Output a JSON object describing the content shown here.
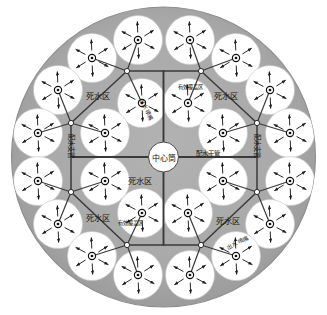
{
  "figure": {
    "type": "engineering-schematic",
    "colors": {
      "dead_zone_fill": "#a8a8a8",
      "coverage_fill": "#ffffff",
      "outline": "#6e6e6e",
      "pipe": "#3a3a3a",
      "text": "#15150f",
      "node_fill": "#ffffff",
      "background": "#ffffff"
    },
    "tank": {
      "cx": 163.5,
      "cy": 157,
      "rx": 152,
      "ry": 150
    },
    "center_cylinder": {
      "cx": 163.5,
      "cy": 157,
      "r": 15
    }
  },
  "labels": {
    "center_cylinder": "中心筒",
    "main_pipe": "配水干管",
    "branch_pipe": "配水支管",
    "dead_zone": "死水区",
    "coverage_zone": "有效覆盖区",
    "nozzle": "出水喷嘴"
  },
  "label_placements": [
    {
      "name": "center-cylinder-label",
      "key": "center_cylinder",
      "x": 163.5,
      "y": 158,
      "size": 8.0,
      "rot": 0,
      "anchor": "middle"
    },
    {
      "name": "main-pipe-label-right",
      "key": "main_pipe",
      "x": 196,
      "y": 154,
      "size": 6.4,
      "rot": 0,
      "anchor": "start"
    },
    {
      "name": "branch-pipe-label-left",
      "key": "branch_pipe",
      "x": 71,
      "y": 146,
      "size": 6.4,
      "rot": 90,
      "anchor": "middle"
    },
    {
      "name": "branch-pipe-label-right",
      "key": "branch_pipe",
      "x": 257,
      "y": 146,
      "size": 6.4,
      "rot": 90,
      "anchor": "middle"
    },
    {
      "name": "dead-zone-label-tl",
      "key": "dead_zone",
      "x": 98,
      "y": 96,
      "size": 8.2,
      "rot": 0,
      "anchor": "middle"
    },
    {
      "name": "dead-zone-label-tr",
      "key": "dead_zone",
      "x": 226,
      "y": 96,
      "size": 8.2,
      "rot": 0,
      "anchor": "middle"
    },
    {
      "name": "dead-zone-label-mid",
      "key": "dead_zone",
      "x": 140,
      "y": 181,
      "size": 8.2,
      "rot": 0,
      "anchor": "middle"
    },
    {
      "name": "dead-zone-label-bl",
      "key": "dead_zone",
      "x": 98,
      "y": 218,
      "size": 8.2,
      "rot": 0,
      "anchor": "middle"
    },
    {
      "name": "dead-zone-label-br",
      "key": "dead_zone",
      "x": 228,
      "y": 221,
      "size": 8.2,
      "rot": 0,
      "anchor": "middle"
    },
    {
      "name": "coverage-zone-label-top",
      "key": "coverage_zone",
      "x": 190,
      "y": 88,
      "size": 5.4,
      "rot": 0,
      "anchor": "middle"
    },
    {
      "name": "coverage-zone-label-bot",
      "key": "coverage_zone",
      "x": 130,
      "y": 224,
      "size": 5.4,
      "rot": 0,
      "anchor": "middle"
    },
    {
      "name": "nozzle-label-top",
      "key": "nozzle",
      "x": 146,
      "y": 110,
      "size": 5.6,
      "rot": 62,
      "anchor": "middle"
    },
    {
      "name": "nozzle-label-bottom",
      "key": "nozzle",
      "x": 238,
      "y": 243,
      "size": 5.6,
      "rot": -28,
      "anchor": "middle"
    }
  ],
  "nozzles": [
    {
      "id": "n01",
      "cx": 138,
      "cy": 40,
      "r": 24.5
    },
    {
      "id": "n02",
      "cx": 190,
      "cy": 40,
      "r": 24.5
    },
    {
      "id": "n03",
      "cx": 92,
      "cy": 58,
      "r": 24.5
    },
    {
      "id": "n04",
      "cx": 236,
      "cy": 58,
      "r": 24.5
    },
    {
      "id": "n05",
      "cx": 58,
      "cy": 90,
      "r": 24.5
    },
    {
      "id": "n06",
      "cx": 270,
      "cy": 90,
      "r": 24.5
    },
    {
      "id": "n07",
      "cx": 142,
      "cy": 103,
      "r": 24.5
    },
    {
      "id": "n08",
      "cx": 188,
      "cy": 103,
      "r": 24.5
    },
    {
      "id": "n09",
      "cx": 38,
      "cy": 133,
      "r": 24.5
    },
    {
      "id": "n10",
      "cx": 105,
      "cy": 133,
      "r": 24.5
    },
    {
      "id": "n11",
      "cx": 223,
      "cy": 133,
      "r": 24.5
    },
    {
      "id": "n12",
      "cx": 290,
      "cy": 133,
      "r": 24.5
    },
    {
      "id": "n13",
      "cx": 38,
      "cy": 181,
      "r": 24.5
    },
    {
      "id": "n14",
      "cx": 105,
      "cy": 181,
      "r": 24.5
    },
    {
      "id": "n15",
      "cx": 223,
      "cy": 181,
      "r": 24.5
    },
    {
      "id": "n16",
      "cx": 290,
      "cy": 181,
      "r": 24.5
    },
    {
      "id": "n17",
      "cx": 142,
      "cy": 213,
      "r": 24.5
    },
    {
      "id": "n18",
      "cx": 188,
      "cy": 213,
      "r": 24.5
    },
    {
      "id": "n19",
      "cx": 58,
      "cy": 224,
      "r": 24.5
    },
    {
      "id": "n20",
      "cx": 270,
      "cy": 224,
      "r": 24.5
    },
    {
      "id": "n21",
      "cx": 92,
      "cy": 256,
      "r": 24.5
    },
    {
      "id": "n22",
      "cx": 236,
      "cy": 256,
      "r": 24.5
    },
    {
      "id": "n23",
      "cx": 138,
      "cy": 275,
      "r": 24.5
    },
    {
      "id": "n24",
      "cx": 190,
      "cy": 275,
      "r": 24.5
    }
  ],
  "junction_nodes": [
    {
      "id": "j-top-left",
      "cx": 127,
      "cy": 71
    },
    {
      "id": "j-top-right",
      "cx": 201,
      "cy": 71
    },
    {
      "id": "j-mid-left",
      "cx": 71,
      "cy": 123
    },
    {
      "id": "j-mid-right",
      "cx": 257,
      "cy": 123
    },
    {
      "id": "j-low-left",
      "cx": 71,
      "cy": 192
    },
    {
      "id": "j-low-right",
      "cx": 257,
      "cy": 192
    },
    {
      "id": "j-bottom-left",
      "cx": 127,
      "cy": 245
    },
    {
      "id": "j-bottom-right",
      "cx": 201,
      "cy": 245
    }
  ],
  "main_pipes": [
    {
      "id": "main-up",
      "x1": 163.5,
      "y1": 142,
      "x2": 163.5,
      "y2": 71
    },
    {
      "id": "main-down",
      "x1": 163.5,
      "y1": 172,
      "x2": 163.5,
      "y2": 245
    },
    {
      "id": "main-left",
      "x1": 148.5,
      "y1": 157,
      "x2": 71,
      "y2": 157
    },
    {
      "id": "main-right",
      "x1": 178.5,
      "y1": 157,
      "x2": 257,
      "y2": 157
    }
  ],
  "branch_pipes": [
    {
      "id": "b-top",
      "x1": 127,
      "y1": 71,
      "x2": 201,
      "y2": 71
    },
    {
      "id": "b-bottom",
      "x1": 127,
      "y1": 245,
      "x2": 201,
      "y2": 245
    },
    {
      "id": "b-left",
      "x1": 71,
      "y1": 123,
      "x2": 71,
      "y2": 192
    },
    {
      "id": "b-right",
      "x1": 257,
      "y1": 123,
      "x2": 257,
      "y2": 192
    },
    {
      "id": "b-tl-diag",
      "x1": 127,
      "y1": 71,
      "x2": 71,
      "y2": 123
    },
    {
      "id": "b-tr-diag",
      "x1": 201,
      "y1": 71,
      "x2": 257,
      "y2": 123
    },
    {
      "id": "b-bl-diag",
      "x1": 127,
      "y1": 245,
      "x2": 71,
      "y2": 192
    },
    {
      "id": "b-br-diag",
      "x1": 201,
      "y1": 245,
      "x2": 257,
      "y2": 192
    }
  ],
  "riser_pipes": [
    {
      "id": "r-j1-n01",
      "x1": 127,
      "y1": 71,
      "x2": 138,
      "y2": 40
    },
    {
      "id": "r-j1-n07",
      "x1": 127,
      "y1": 71,
      "x2": 142,
      "y2": 103
    },
    {
      "id": "r-j1-n03",
      "x1": 127,
      "y1": 71,
      "x2": 92,
      "y2": 58
    },
    {
      "id": "r-j2-n02",
      "x1": 201,
      "y1": 71,
      "x2": 190,
      "y2": 40
    },
    {
      "id": "r-j2-n08",
      "x1": 201,
      "y1": 71,
      "x2": 188,
      "y2": 103
    },
    {
      "id": "r-j2-n04",
      "x1": 201,
      "y1": 71,
      "x2": 236,
      "y2": 58
    },
    {
      "id": "r-j3-n05",
      "x1": 71,
      "y1": 123,
      "x2": 58,
      "y2": 90
    },
    {
      "id": "r-j3-n09",
      "x1": 71,
      "y1": 123,
      "x2": 38,
      "y2": 133
    },
    {
      "id": "r-j3-n10",
      "x1": 71,
      "y1": 123,
      "x2": 105,
      "y2": 133
    },
    {
      "id": "r-j4-n06",
      "x1": 257,
      "y1": 123,
      "x2": 270,
      "y2": 90
    },
    {
      "id": "r-j4-n12",
      "x1": 257,
      "y1": 123,
      "x2": 290,
      "y2": 133
    },
    {
      "id": "r-j4-n11",
      "x1": 257,
      "y1": 123,
      "x2": 223,
      "y2": 133
    },
    {
      "id": "r-j5-n13",
      "x1": 71,
      "y1": 192,
      "x2": 38,
      "y2": 181
    },
    {
      "id": "r-j5-n14",
      "x1": 71,
      "y1": 192,
      "x2": 105,
      "y2": 181
    },
    {
      "id": "r-j5-n19",
      "x1": 71,
      "y1": 192,
      "x2": 58,
      "y2": 224
    },
    {
      "id": "r-j6-n16",
      "x1": 257,
      "y1": 192,
      "x2": 290,
      "y2": 181
    },
    {
      "id": "r-j6-n15",
      "x1": 257,
      "y1": 192,
      "x2": 223,
      "y2": 181
    },
    {
      "id": "r-j6-n20",
      "x1": 257,
      "y1": 192,
      "x2": 270,
      "y2": 224
    },
    {
      "id": "r-j7-n17",
      "x1": 127,
      "y1": 245,
      "x2": 142,
      "y2": 213
    },
    {
      "id": "r-j7-n21",
      "x1": 127,
      "y1": 245,
      "x2": 92,
      "y2": 256
    },
    {
      "id": "r-j7-n23",
      "x1": 127,
      "y1": 245,
      "x2": 138,
      "y2": 275
    },
    {
      "id": "r-j8-n18",
      "x1": 201,
      "y1": 245,
      "x2": 188,
      "y2": 213
    },
    {
      "id": "r-j8-n22",
      "x1": 201,
      "y1": 245,
      "x2": 236,
      "y2": 256
    },
    {
      "id": "r-j8-n24",
      "x1": 201,
      "y1": 245,
      "x2": 190,
      "y2": 275
    }
  ],
  "spray_arrows": {
    "count": 6,
    "inner_radius": 7.5,
    "outer_radius": 18.5,
    "start_angle": 28
  }
}
